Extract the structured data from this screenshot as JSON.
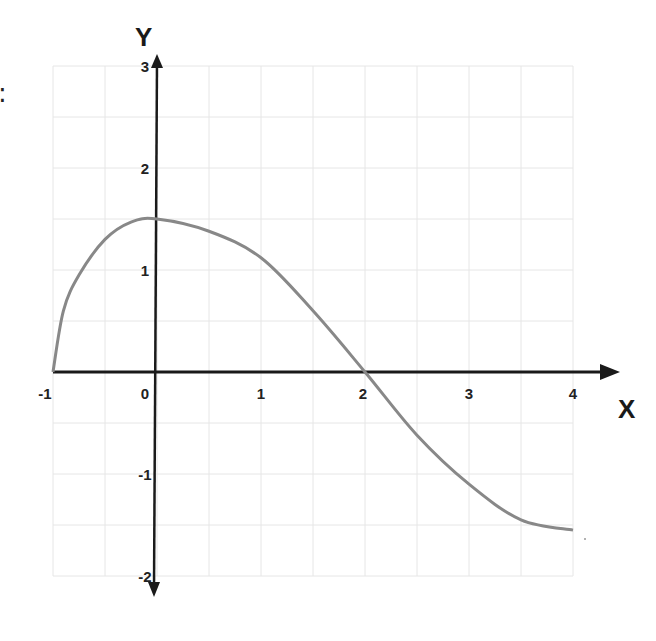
{
  "page": {
    "stray_text": ":"
  },
  "chart_data": {
    "type": "line",
    "title": "",
    "xlabel": "X",
    "ylabel": "Y",
    "xlim": [
      -1,
      4
    ],
    "ylim": [
      -2,
      3
    ],
    "grid": true,
    "grid_step": 0.5,
    "legend": null,
    "x_ticks": [
      -1,
      0,
      1,
      2,
      3,
      4
    ],
    "x_tick_labels": [
      "-1",
      "0",
      "1",
      "2",
      "3",
      "4"
    ],
    "y_ticks": [
      -2,
      -1,
      1,
      2,
      3
    ],
    "y_tick_labels": [
      "-2",
      "-1",
      "1",
      "2",
      "3"
    ],
    "series": [
      {
        "name": "f(x)",
        "color": "#888888",
        "x": [
          -1,
          -0.9,
          -0.75,
          -0.5,
          -0.25,
          0,
          0.5,
          1,
          1.5,
          2,
          2.5,
          3,
          3.5,
          4
        ],
        "y": [
          0,
          0.6,
          0.95,
          1.3,
          1.47,
          1.5,
          1.38,
          1.12,
          0.6,
          0,
          -0.62,
          -1.1,
          -1.45,
          -1.55
        ]
      }
    ],
    "colors": {
      "axis": "#1a1a1a",
      "grid": "#e6e6e6",
      "curve": "#888888",
      "text": "#222222"
    }
  }
}
